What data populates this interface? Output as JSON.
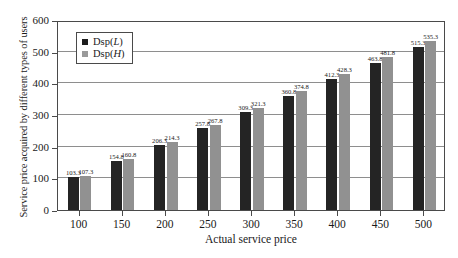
{
  "chart_data": {
    "type": "bar",
    "title": "",
    "xlabel": "Actual service price",
    "ylabel": "Service price acquired by different types of users",
    "categories": [
      "100",
      "150",
      "200",
      "250",
      "300",
      "350",
      "400",
      "450",
      "500"
    ],
    "series": [
      {
        "name": "Dsp(L)",
        "color": "#242424",
        "values": [
          103.3,
          154.8,
          206.3,
          257.8,
          309.3,
          360.8,
          412.3,
          463.8,
          515.3
        ],
        "labels": [
          "103.3",
          "154.8",
          "206.3",
          "257.8",
          "309.3",
          "360.8",
          "412.3",
          "463.8",
          "515.3"
        ]
      },
      {
        "name": "Dsp(H)",
        "color": "#919191",
        "values": [
          107.3,
          160.8,
          214.3,
          267.8,
          321.3,
          374.8,
          428.3,
          481.8,
          535.3
        ],
        "labels": [
          "107.3",
          "160.8",
          "214.3",
          "267.8",
          "321.3",
          "374.8",
          "428.3",
          "481.8",
          "535.3"
        ]
      }
    ],
    "ylim": [
      0,
      600
    ],
    "yticks": [
      0,
      100,
      200,
      300,
      400,
      500,
      600
    ],
    "ytick_labels": [
      "0",
      "100",
      "200",
      "300",
      "400",
      "500",
      "600"
    ],
    "grid": "horizontal",
    "legend_position": "upper-left-inside",
    "legend": [
      {
        "label_base": "Dsp(",
        "label_italic": "L",
        "label_close": ")",
        "swatch": "l"
      },
      {
        "label_base": "Dsp(",
        "label_italic": "H",
        "label_close": ")",
        "swatch": "h"
      }
    ]
  }
}
